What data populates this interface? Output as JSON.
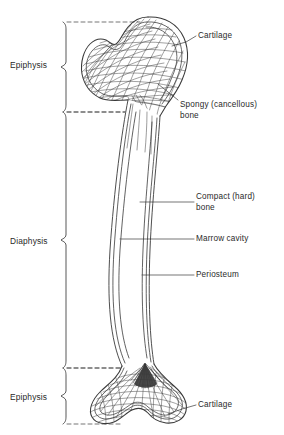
{
  "figure": {
    "background_color": "#ffffff",
    "line_color": "#3a3a3a",
    "text_color": "#2a2a2a"
  },
  "region_brackets": [
    {
      "id": "epiphysis-top",
      "label": "Epiphysis",
      "label_x": 10,
      "label_y": 60,
      "bracket_x": 66,
      "bracket_top": 22,
      "bracket_bottom": 112,
      "dash_top_x2": 140,
      "dash_bottom_x2": 125
    },
    {
      "id": "diaphysis",
      "label": "Diaphysis",
      "label_x": 10,
      "label_y": 236,
      "bracket_x": 66,
      "bracket_top": 112,
      "bracket_bottom": 368,
      "dash_top_x2": 125,
      "dash_bottom_x2": 120
    },
    {
      "id": "epiphysis-bottom",
      "label": "Epiphysis",
      "label_x": 10,
      "label_y": 392,
      "bracket_x": 66,
      "bracket_top": 368,
      "bracket_bottom": 424,
      "dash_top_x2": 120,
      "dash_bottom_x2": 122
    }
  ],
  "callouts": [
    {
      "id": "cartilage-top",
      "lines": [
        "Cartilage"
      ],
      "text_x": 198,
      "text_y": 31,
      "leader": "M 196 36 L 186 42 L 172 46"
    },
    {
      "id": "spongy-bone",
      "lines": [
        "Spongy (cancellous)",
        "bone"
      ],
      "text_x": 180,
      "text_y": 100,
      "leader": "M 178 100 L 168 92 L 158 84"
    },
    {
      "id": "compact-bone",
      "lines": [
        "Compact (hard)",
        "bone"
      ],
      "text_x": 196,
      "text_y": 192,
      "leader": "M 194 202 L 140 202"
    },
    {
      "id": "marrow-cavity",
      "lines": [
        "Marrow cavity"
      ],
      "text_x": 196,
      "text_y": 234,
      "leader": "M 194 239 L 120 239"
    },
    {
      "id": "periosteum",
      "lines": [
        "Periosteum"
      ],
      "text_x": 196,
      "text_y": 270,
      "leader": "M 194 275 L 142 275"
    },
    {
      "id": "cartilage-bottom",
      "lines": [
        "Cartilage"
      ],
      "text_x": 198,
      "text_y": 400,
      "leader": "M 196 405 L 182 409 L 168 414"
    }
  ]
}
